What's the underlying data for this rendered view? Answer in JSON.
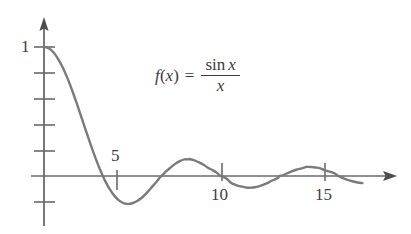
{
  "figure": {
    "background_color": "#ffffff",
    "curve_color": "#7a7a7a",
    "axis_color": "#5a5a5a",
    "text_color": "#3a3a3a"
  },
  "formula": {
    "lhs": "f",
    "lparen": "(",
    "arg": "x",
    "rparen": ")",
    "equals": "=",
    "numerator_fn": "sin",
    "numerator_arg": "x",
    "denominator": "x"
  },
  "axes": {
    "y_label_1": "1",
    "x_tick_labels": [
      "5",
      "10",
      "15"
    ],
    "x_origin": 0
  },
  "chart_data": {
    "type": "line",
    "xlabel": "x",
    "ylabel": "f(x)",
    "xlim": [
      0,
      17
    ],
    "ylim": [
      -0.35,
      1.05
    ],
    "grid": false,
    "legend": null,
    "annotations": [
      {
        "text": "f(x) = sin x / x",
        "x": 8.2,
        "y": 0.72
      }
    ],
    "x_ticks": [
      5,
      10,
      15
    ],
    "x_tick_labels": [
      "5",
      "10",
      "15"
    ],
    "y_ticks": [
      -0.2,
      0.2,
      0.4,
      0.6,
      0.8,
      1.0
    ],
    "y_tick_labels": [
      "",
      "",
      "",
      "",
      "",
      "1"
    ],
    "series": [
      {
        "name": "sin(x)/x",
        "color": "#7a7a7a",
        "x": [
          0.0,
          0.25,
          0.5,
          0.75,
          1.0,
          1.25,
          1.5,
          1.75,
          2.0,
          2.25,
          2.5,
          2.75,
          3.0,
          3.141592653589793,
          3.25,
          3.5,
          3.75,
          4.0,
          4.25,
          4.5,
          4.493409,
          4.75,
          5.0,
          5.25,
          5.5,
          5.75,
          6.0,
          6.25,
          6.283185307179586,
          6.5,
          6.75,
          7.0,
          7.25,
          7.5,
          7.725251,
          7.75,
          8.0,
          8.25,
          8.5,
          8.75,
          9.0,
          9.25,
          9.42477796076938,
          9.5,
          9.75,
          10.0,
          10.25,
          10.5,
          10.75,
          10.904122,
          11.0,
          11.25,
          11.5,
          11.75,
          12.0,
          12.25,
          12.5,
          12.566370614359172,
          12.75,
          13.0,
          13.25,
          13.5,
          13.75,
          14.0,
          14.066194,
          14.25,
          14.5,
          14.75,
          15.0,
          15.25,
          15.5,
          15.707963267948966,
          15.75,
          16.0,
          16.25,
          16.5,
          16.75,
          17.0
        ],
        "y": [
          1.0,
          0.98975,
          0.95885,
          0.90885,
          0.84147,
          0.7587,
          0.665,
          0.5624,
          0.45465,
          0.34588,
          0.23939,
          0.1385,
          0.04704,
          0.0,
          -0.0339,
          -0.10022,
          -0.15216,
          -0.1892,
          -0.21124,
          -0.21723,
          -0.21723,
          -0.2093,
          -0.19178,
          -0.16497,
          -0.12911,
          -0.08697,
          -0.04657,
          -0.0001,
          0.0,
          0.03334,
          0.0649,
          0.09385,
          0.11568,
          0.12935,
          0.1285,
          0.132,
          0.12367,
          0.10723,
          0.08863,
          0.06405,
          0.04579,
          0.02241,
          0.0,
          -0.00221,
          -0.02129,
          -0.0544,
          -0.07,
          -0.08105,
          -0.08772,
          -0.09132,
          -0.0909,
          -0.0868,
          -0.07775,
          -0.06479,
          -0.04894,
          -0.03127,
          -0.0129,
          0.0,
          0.00535,
          0.02257,
          0.03788,
          0.05055,
          0.05966,
          0.07057,
          0.07092,
          0.0697,
          0.06595,
          0.05932,
          0.04338,
          0.03395,
          0.02117,
          0.0,
          -0.00266,
          -0.018,
          -0.0315,
          -0.0427,
          -0.0508,
          -0.05545
        ]
      }
    ]
  }
}
